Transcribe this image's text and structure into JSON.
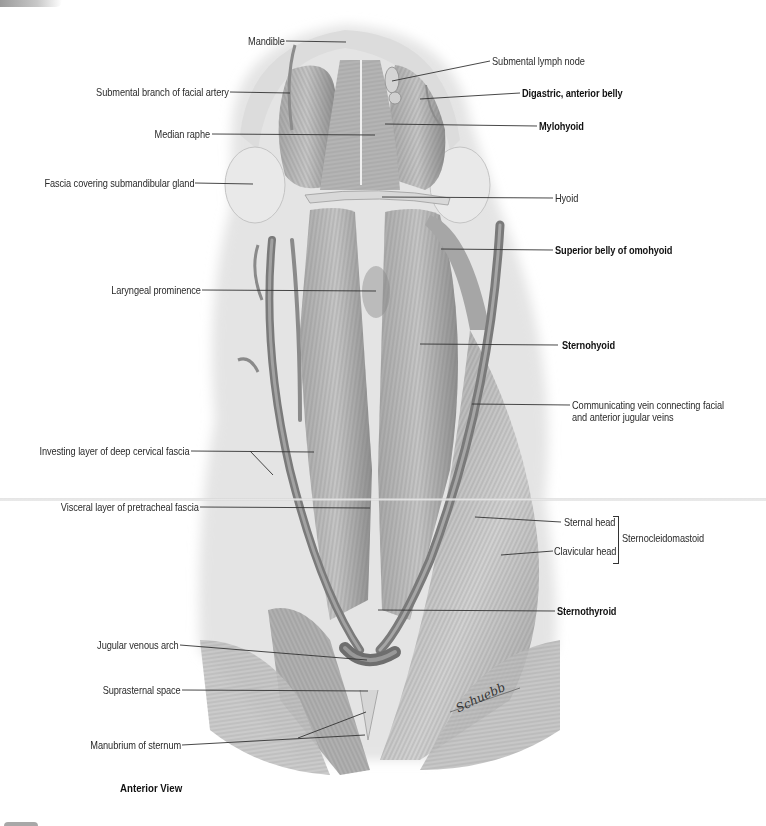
{
  "figure": {
    "view_caption": "Anterior View",
    "colors": {
      "background": "#ffffff",
      "skin_fascia": "#e6e6e6",
      "muscle_light": "#bdbdbd",
      "muscle_mid": "#9a9a9a",
      "muscle_dark": "#6e6e6e",
      "vein": "#7d7d7d",
      "label_text": "#2a2a2a",
      "leader_line": "#333333"
    },
    "labels_left": [
      {
        "id": "mandible",
        "text": "Mandible",
        "bold": false
      },
      {
        "id": "submental-branch",
        "text": "Submental branch of facial artery",
        "bold": false
      },
      {
        "id": "median-raphe",
        "text": "Median raphe",
        "bold": false
      },
      {
        "id": "fascia-submandibular",
        "text": "Fascia covering submandibular gland",
        "bold": false
      },
      {
        "id": "laryngeal-prominence",
        "text": "Laryngeal prominence",
        "bold": false
      },
      {
        "id": "investing-layer",
        "text": "Investing layer of deep cervical fascia",
        "bold": false
      },
      {
        "id": "visceral-layer",
        "text": "Visceral layer of pretracheal fascia",
        "bold": false
      },
      {
        "id": "jugular-venous-arch",
        "text": "Jugular venous arch",
        "bold": false
      },
      {
        "id": "suprasternal-space",
        "text": "Suprasternal space",
        "bold": false
      },
      {
        "id": "manubrium",
        "text": "Manubrium of sternum",
        "bold": false
      }
    ],
    "labels_right": [
      {
        "id": "submental-lymph-node",
        "text": "Submental lymph node",
        "bold": false
      },
      {
        "id": "digastric",
        "text": "Digastric, anterior belly",
        "bold": true
      },
      {
        "id": "mylohyoid",
        "text": "Mylohyoid",
        "bold": true
      },
      {
        "id": "hyoid",
        "text": "Hyoid",
        "bold": false
      },
      {
        "id": "omohyoid",
        "text": "Superior belly of omohyoid",
        "bold": true
      },
      {
        "id": "sternohyoid",
        "text": "Sternohyoid",
        "bold": true
      },
      {
        "id": "communicating-vein-1",
        "text": "Communicating vein connecting facial",
        "bold": false
      },
      {
        "id": "communicating-vein-2",
        "text": "and anterior jugular veins",
        "bold": false
      },
      {
        "id": "sternal-head",
        "text": "Sternal head",
        "bold": false
      },
      {
        "id": "clavicular-head",
        "text": "Clavicular head",
        "bold": false
      },
      {
        "id": "sternocleidomastoid",
        "text": "Sternocleidomastoid",
        "bold": false
      },
      {
        "id": "sternothyroid",
        "text": "Sternothyroid",
        "bold": true
      }
    ],
    "signature": "Schuebb"
  }
}
